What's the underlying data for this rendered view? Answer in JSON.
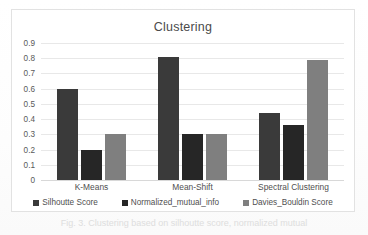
{
  "figure": {
    "caption": "Fig. 3.  Clustering based on silhoutte score, normalized mutual"
  },
  "colors": {
    "series1": "#3a3a3a",
    "series2": "#262626",
    "series3": "#7f7f7f",
    "gridline": "#e8e8e8",
    "border": "#e2e2e2",
    "text": "#4f4f4f"
  },
  "chart_data": {
    "type": "bar",
    "title": "Clustering",
    "xlabel": "",
    "ylabel": "",
    "ylim": [
      0,
      0.9
    ],
    "grid": true,
    "legend_position": "bottom",
    "categories": [
      "K-Means",
      "Mean-Shift",
      "Spectral Clustering"
    ],
    "yticks": [
      "0",
      "0.1",
      "0.2",
      "0.3",
      "0.4",
      "0.5",
      "0.6",
      "0.7",
      "0.8",
      "0.9"
    ],
    "ytick_values": [
      0,
      0.1,
      0.2,
      0.3,
      0.4,
      0.5,
      0.6,
      0.7,
      0.8,
      0.9
    ],
    "series": [
      {
        "name": "Silhoutte Score",
        "color": "#3a3a3a",
        "values": [
          0.6,
          0.81,
          0.44
        ]
      },
      {
        "name": "Normalized_mutual_info",
        "color": "#262626",
        "values": [
          0.2,
          0.3,
          0.36
        ]
      },
      {
        "name": "Davies_Bouldin Score",
        "color": "#7f7f7f",
        "values": [
          0.3,
          0.3,
          0.79
        ]
      }
    ]
  }
}
